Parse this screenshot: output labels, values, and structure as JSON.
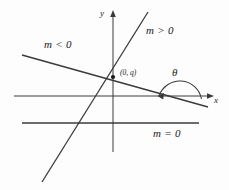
{
  "figure": {
    "background_color": "#fdfdfd",
    "stroke_color": "#3a3a3a",
    "text_color": "#1a1a1a"
  },
  "axes": {
    "y_label": "y",
    "x_label": "x",
    "origin": {
      "x": 113,
      "y": 96
    },
    "y_axis": {
      "x": 113,
      "y_top": 14,
      "y_bottom": 152,
      "arrow": "up"
    },
    "x_axis": {
      "y": 96,
      "x_left": 14,
      "x_right": 210,
      "arrow": "right"
    }
  },
  "lines": [
    {
      "name": "positive-slope-line",
      "label": "m > 0",
      "slope_sign": "positive",
      "x1": 148,
      "y1": 12,
      "x2": 42,
      "y2": 182
    },
    {
      "name": "negative-slope-line",
      "label": "m < 0",
      "slope_sign": "negative",
      "x1": 22,
      "y1": 55,
      "x2": 208,
      "y2": 107
    },
    {
      "name": "zero-slope-line",
      "label": "m = 0",
      "slope_sign": "zero",
      "x1": 22,
      "y1": 123,
      "x2": 199,
      "y2": 123
    }
  ],
  "annotations": {
    "y_intercept_point": {
      "label": "(0, q)",
      "x": 113,
      "y": 77
    },
    "angle": {
      "symbol": "θ",
      "arc_center_x": 180,
      "arc_center_y": 103,
      "arc_radius": 22,
      "description": "angle between x-axis and negative-slope line"
    }
  }
}
